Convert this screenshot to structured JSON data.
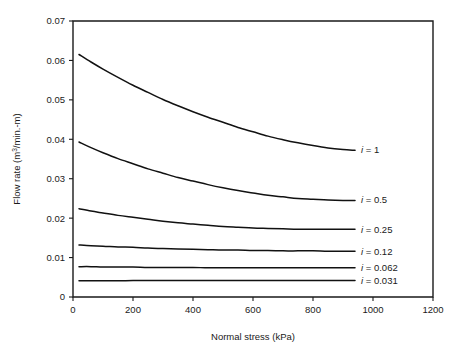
{
  "chart_data": {
    "type": "line",
    "title": "",
    "xlabel": "Normal stress (kPa)",
    "ylabel": "Flow rate (m3/min.-m)",
    "ylabel_parts": {
      "prefix": "Flow rate (m",
      "superscript": "3",
      "suffix": "/min.-m)"
    },
    "xlim": [
      0,
      1200
    ],
    "ylim": [
      0,
      0.07
    ],
    "grid": false,
    "legend_position": "right-of-curve-ends",
    "xticks": [
      0,
      200,
      400,
      600,
      800,
      1000,
      1200
    ],
    "xtick_labels": [
      "0",
      "200",
      "400",
      "600",
      "800",
      "1000",
      "1200"
    ],
    "yticks": [
      0,
      0.01,
      0.02,
      0.03,
      0.04,
      0.05,
      0.06,
      0.07
    ],
    "ytick_labels": [
      "0",
      "0.01",
      "0.02",
      "0.03",
      "0.04",
      "0.05",
      "0.06",
      "0.07"
    ],
    "series": [
      {
        "name": "i = 1",
        "label_prefix": "i",
        "label_suffix": " = 1",
        "label_x": 960,
        "label_y": 0.0373,
        "x": [
          20,
          60,
          100,
          150,
          200,
          250,
          300,
          350,
          400,
          450,
          500,
          550,
          600,
          650,
          700,
          750,
          800,
          850,
          900,
          940
        ],
        "values": [
          0.0615,
          0.0596,
          0.0578,
          0.0557,
          0.0537,
          0.0519,
          0.0501,
          0.0485,
          0.047,
          0.0456,
          0.0443,
          0.043,
          0.0419,
          0.0408,
          0.0399,
          0.0391,
          0.0384,
          0.0378,
          0.0374,
          0.0372
        ]
      },
      {
        "name": "i = 0.5",
        "label_prefix": "i",
        "label_suffix": " = 0.5",
        "label_x": 960,
        "label_y": 0.0246,
        "x": [
          20,
          60,
          100,
          150,
          200,
          250,
          300,
          350,
          400,
          450,
          500,
          550,
          600,
          650,
          700,
          750,
          800,
          850,
          900,
          940
        ],
        "values": [
          0.0393,
          0.0379,
          0.0366,
          0.0351,
          0.0338,
          0.0325,
          0.0314,
          0.0303,
          0.0294,
          0.0285,
          0.0277,
          0.027,
          0.0264,
          0.0258,
          0.0254,
          0.025,
          0.0248,
          0.0246,
          0.0245,
          0.0245
        ]
      },
      {
        "name": "i = 0.25",
        "label_prefix": "i",
        "label_suffix": " = 0.25",
        "label_x": 960,
        "label_y": 0.0172,
        "x": [
          20,
          60,
          100,
          150,
          200,
          250,
          300,
          350,
          400,
          450,
          500,
          550,
          600,
          650,
          700,
          750,
          800,
          850,
          900,
          940
        ],
        "values": [
          0.0224,
          0.0218,
          0.0213,
          0.0207,
          0.0202,
          0.0197,
          0.0192,
          0.0188,
          0.0185,
          0.0182,
          0.0179,
          0.0177,
          0.0175,
          0.0174,
          0.0173,
          0.0172,
          0.0172,
          0.0172,
          0.0172,
          0.0172
        ]
      },
      {
        "name": "i = 0.12",
        "label_prefix": "i",
        "label_suffix": " = 0.12",
        "label_x": 960,
        "label_y": 0.0116,
        "x": [
          20,
          60,
          100,
          150,
          200,
          250,
          300,
          350,
          400,
          450,
          500,
          550,
          600,
          650,
          700,
          750,
          800,
          850,
          900,
          940
        ],
        "values": [
          0.0132,
          0.013,
          0.0129,
          0.0127,
          0.0126,
          0.0124,
          0.0123,
          0.0122,
          0.0121,
          0.012,
          0.0119,
          0.0119,
          0.0118,
          0.0118,
          0.0117,
          0.0117,
          0.0117,
          0.0116,
          0.0116,
          0.0116
        ]
      },
      {
        "name": "i = 0.062",
        "label_prefix": "i",
        "label_suffix": " = 0.062",
        "label_x": 960,
        "label_y": 0.0074,
        "x": [
          20,
          60,
          100,
          150,
          200,
          250,
          300,
          350,
          400,
          450,
          500,
          550,
          600,
          650,
          700,
          750,
          800,
          850,
          900,
          940
        ],
        "values": [
          0.0077,
          0.0077,
          0.0076,
          0.0076,
          0.0076,
          0.0075,
          0.0075,
          0.0075,
          0.0075,
          0.0074,
          0.0074,
          0.0074,
          0.0074,
          0.0074,
          0.0074,
          0.0074,
          0.0074,
          0.0074,
          0.0074,
          0.0074
        ]
      },
      {
        "name": "i = 0.031",
        "label_prefix": "i",
        "label_suffix": " = 0.031",
        "label_x": 960,
        "label_y": 0.0042,
        "x": [
          20,
          60,
          100,
          150,
          200,
          250,
          300,
          350,
          400,
          450,
          500,
          550,
          600,
          650,
          700,
          750,
          800,
          850,
          900,
          940
        ],
        "values": [
          0.0041,
          0.0041,
          0.0041,
          0.0041,
          0.0042,
          0.0042,
          0.0042,
          0.0042,
          0.0042,
          0.0042,
          0.0042,
          0.0042,
          0.0042,
          0.0042,
          0.0042,
          0.0042,
          0.0042,
          0.0042,
          0.0042,
          0.0042
        ]
      }
    ]
  },
  "plot_geometry": {
    "left": 73,
    "right": 433,
    "top": 21,
    "bottom": 297
  },
  "colors": {
    "curve": "#111111",
    "axis": "#1a1a1a",
    "background": "#ffffff"
  }
}
